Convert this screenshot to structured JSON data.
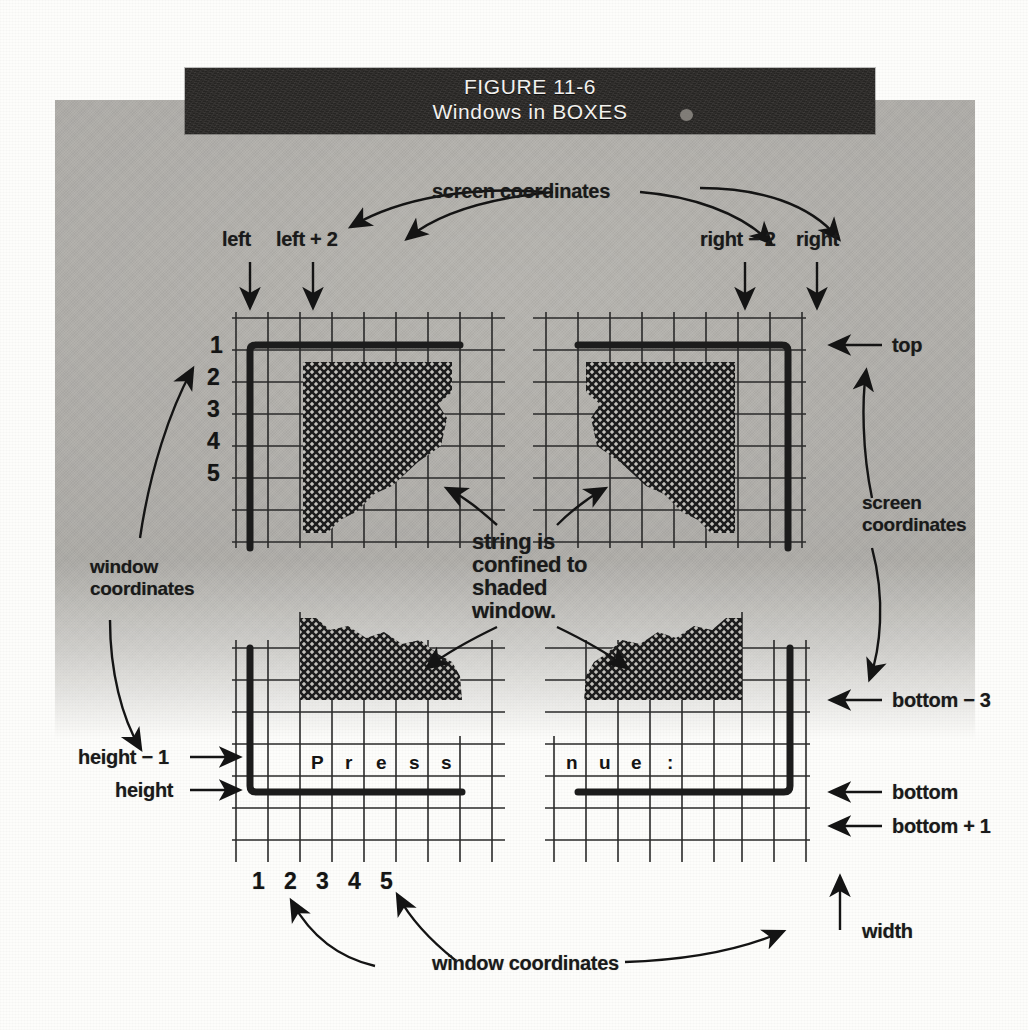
{
  "figure": {
    "banner_line1": "FIGURE 11-6",
    "banner_line2": "Windows in BOXES"
  },
  "labels": {
    "screen_coordinates_top": "screen coordinates",
    "left": "left",
    "left_plus_2": "left + 2",
    "right_minus_2": "right − 2",
    "right": "right",
    "top": "top",
    "screen_coordinates_right_l1": "screen",
    "screen_coordinates_right_l2": "coordinates",
    "bottom_minus_3": "bottom − 3",
    "bottom": "bottom",
    "bottom_plus_1": "bottom + 1",
    "window_coordinates_left_l1": "window",
    "window_coordinates_left_l2": "coordinates",
    "height_minus_1": "height − 1",
    "height": "height",
    "window_coordinates_bottom": "window coordinates",
    "width": "width",
    "callout_l1": "string is",
    "callout_l2": "confined to",
    "callout_l3": "shaded",
    "callout_l4": "window."
  },
  "row_numbers": [
    "1",
    "2",
    "3",
    "4",
    "5"
  ],
  "column_numbers": [
    "1",
    "2",
    "3",
    "4",
    "5"
  ],
  "text_cells": {
    "bottom_left_string": [
      "P",
      "r",
      "e",
      "s",
      "s"
    ],
    "bottom_right_string": [
      "n",
      "u",
      "e",
      ":"
    ]
  },
  "colors": {
    "paper": "#fdfdfb",
    "gray_field": "#b9b7b2",
    "banner": "#2e2c2a",
    "banner_text": "#f2f1ee",
    "ink": "#141414",
    "grid_line": "#2a2a2a"
  }
}
